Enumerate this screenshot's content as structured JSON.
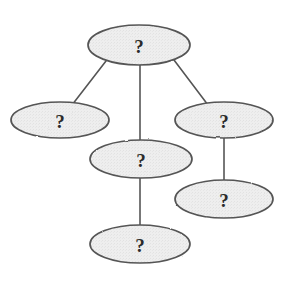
{
  "diagram": {
    "type": "node-link-graph",
    "title": "",
    "background_color": "#ffffff",
    "node_shape": "ellipse",
    "node_fill_color": "#eeeeee",
    "node_stroke_color": "#555555",
    "edge_color": "#555555",
    "label_color": "#2b2b2b",
    "nodes": [
      {
        "id": "n1",
        "label": "?",
        "cx": 139,
        "cy": 45,
        "rx": 51,
        "ry": 20,
        "name": "node-top"
      },
      {
        "id": "n2",
        "label": "?",
        "cx": 60,
        "cy": 120,
        "rx": 49,
        "ry": 18,
        "name": "node-left"
      },
      {
        "id": "n3",
        "label": "?",
        "cx": 224,
        "cy": 120,
        "rx": 49,
        "ry": 18,
        "name": "node-right"
      },
      {
        "id": "n4",
        "label": "?",
        "cx": 141,
        "cy": 159,
        "rx": 51,
        "ry": 19,
        "name": "node-middle"
      },
      {
        "id": "n5",
        "label": "?",
        "cx": 224,
        "cy": 199,
        "rx": 49,
        "ry": 19,
        "name": "node-lower-right"
      },
      {
        "id": "n6",
        "label": "?",
        "cx": 140,
        "cy": 244,
        "rx": 50,
        "ry": 19,
        "name": "node-bottom"
      }
    ],
    "edges": [
      {
        "from": "n1",
        "to": "n2",
        "x1": 106,
        "y1": 61,
        "x2": 72,
        "y2": 105,
        "name": "edge-top-to-left"
      },
      {
        "from": "n1",
        "to": "n4",
        "x1": 140,
        "y1": 65,
        "x2": 140,
        "y2": 140,
        "name": "edge-top-to-middle"
      },
      {
        "from": "n1",
        "to": "n3",
        "x1": 174,
        "y1": 60,
        "x2": 208,
        "y2": 105,
        "name": "edge-top-to-right"
      },
      {
        "from": "n3",
        "to": "n5",
        "x1": 224,
        "y1": 138,
        "x2": 224,
        "y2": 180,
        "name": "edge-right-to-lower-right"
      },
      {
        "from": "n4",
        "to": "n6",
        "x1": 140,
        "y1": 178,
        "x2": 140,
        "y2": 225,
        "name": "edge-middle-to-bottom"
      }
    ]
  }
}
